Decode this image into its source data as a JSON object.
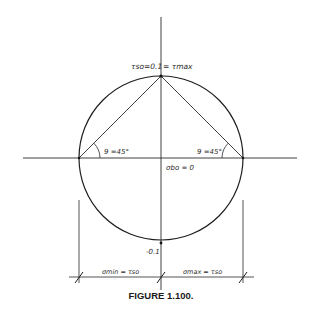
{
  "figure": {
    "caption": "FIGURE 1.100.",
    "type": "Mohr's circle (pure shear)",
    "colors": {
      "line": "#2a2a2a",
      "background": "#ffffff"
    }
  },
  "labels": {
    "top_point": "τ₀=0.1 = τmax",
    "top_point_left": "τso=0.1",
    "top_point_right": "= τmax",
    "angle_left": "9 =45°",
    "angle_right": "9 =45°",
    "center": "σbo = 0",
    "bottom_point": "-0.1",
    "dim_left": "σmin = τso",
    "dim_right": "σmax = τso"
  }
}
